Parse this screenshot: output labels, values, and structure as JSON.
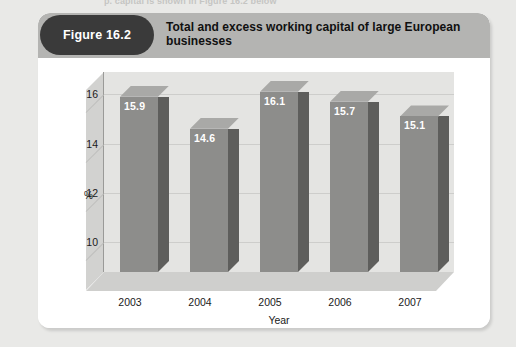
{
  "page": {
    "cut_off_line": "p. capital is shown in Figure 16.2 below",
    "background_color": "#e9e9e7"
  },
  "figure": {
    "badge_label": "Figure 16.2",
    "title": "Total and excess working capital of large European businesses",
    "header_color": "#b4b4b2",
    "badge_color": "#3a3a3a",
    "card_color": "#ffffff"
  },
  "chart_data": {
    "type": "bar",
    "title": "Total and excess working capital of large European businesses",
    "categories": [
      "2003",
      "2004",
      "2005",
      "2006",
      "2007"
    ],
    "values": [
      15.9,
      14.6,
      16.1,
      15.7,
      15.1
    ],
    "value_labels": [
      "15.9",
      "14.6",
      "16.1",
      "15.7",
      "15.1"
    ],
    "xlabel": "Year",
    "ylabel": "%",
    "yticks": [
      10,
      12,
      14,
      16
    ],
    "ytick_labels": [
      "10",
      "12",
      "14",
      "16"
    ],
    "ylim": [
      8.8,
      16.9
    ],
    "grid": true,
    "legend": "none",
    "three_d": true,
    "series_color": "#8d8d8b",
    "plot_background": "#e4e4e2"
  }
}
